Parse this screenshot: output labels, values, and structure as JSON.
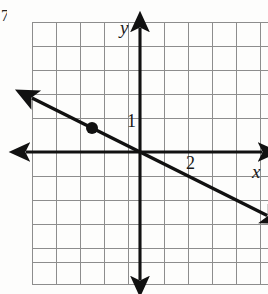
{
  "figure": {
    "kind": "coordinate-plane-line-graph",
    "problem_number": "7.",
    "background_color": "#fdfdfc"
  },
  "axes": {
    "x_label": "x",
    "y_label": "y",
    "axis_color": "#111111",
    "origin_px": {
      "x": 140,
      "y": 152
    },
    "cell_px": 24
  },
  "grid": {
    "color": "#8d8d8d",
    "line_width": 1,
    "left_px": 32,
    "top_px": 22,
    "right_px": 268,
    "bottom_px": 284,
    "columns": 10,
    "rows": 11
  },
  "tick_labels": [
    {
      "text": "1",
      "axis": "y",
      "value": 1
    },
    {
      "text": "2",
      "axis": "x",
      "value": 2
    }
  ],
  "chart_data": {
    "type": "line",
    "title": "",
    "xlabel": "x",
    "ylabel": "y",
    "xlim": [
      -4.5,
      5.3
    ],
    "ylim": [
      -5.4,
      5.4
    ],
    "grid": true,
    "legend": null,
    "series": [
      {
        "name": "line",
        "equation": "y = -0.5x",
        "slope": -0.5,
        "intercept": 0,
        "arrow_both_ends": true,
        "color": "#111111",
        "x": [
          -4.5,
          5.3
        ],
        "y": [
          2.25,
          -2.65
        ]
      }
    ],
    "points": [
      {
        "label": "",
        "x": -2,
        "y": 1,
        "style": "filled-dot",
        "color": "#111111"
      }
    ],
    "annotations": [
      {
        "text": "1",
        "x": -0.55,
        "y": 1.0
      },
      {
        "text": "2",
        "x": 2.0,
        "y": -0.45
      }
    ]
  }
}
